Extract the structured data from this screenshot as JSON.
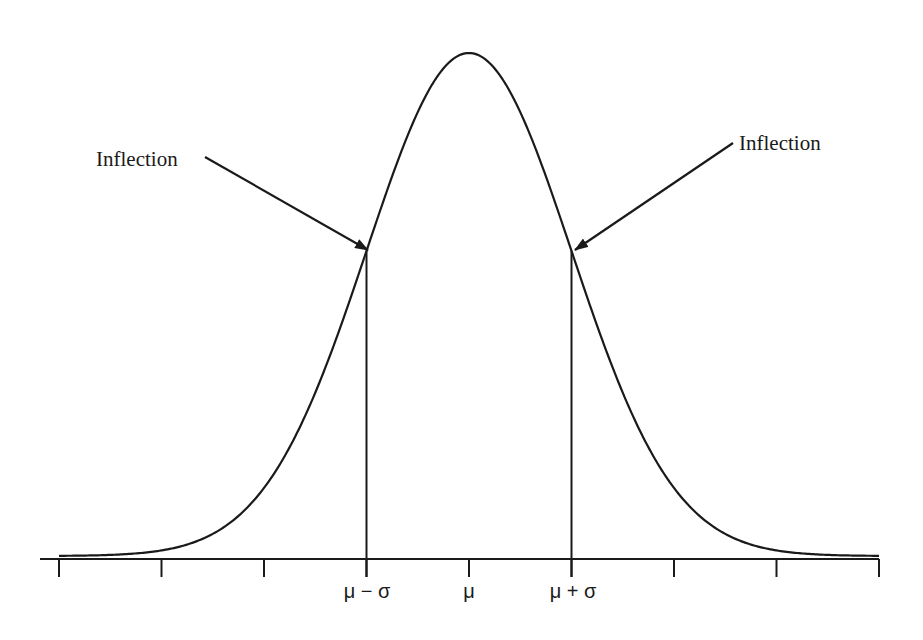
{
  "figure": {
    "type": "normal-distribution-diagram",
    "colors": {
      "ink": "#1a1a1a",
      "background": "#ffffff"
    },
    "annotations": [
      {
        "label": "Inflection",
        "side": "left",
        "points_to": "μ − σ"
      },
      {
        "label": "Inflection",
        "side": "right",
        "points_to": "μ + σ"
      }
    ],
    "axis": {
      "tick_count": 9,
      "labels": [
        {
          "text": "μ − σ",
          "tick_index": 3
        },
        {
          "text": "μ",
          "tick_index": 4
        },
        {
          "text": "μ + σ",
          "tick_index": 5
        }
      ]
    }
  },
  "chart_data": {
    "type": "line",
    "title": "",
    "xlabel": "",
    "ylabel": "",
    "x_ticks_sigma": [
      -4,
      -3,
      -2,
      -1,
      0,
      1,
      2,
      3,
      4
    ],
    "x_tick_labels": [
      "",
      "",
      "",
      "μ − σ",
      "μ",
      "μ + σ",
      "",
      "",
      ""
    ],
    "xlim_sigma": [
      -4,
      4
    ],
    "series": [
      {
        "name": "normal density",
        "function": "exp(-z^2/2)",
        "z_range": [
          -4,
          4
        ]
      }
    ],
    "vertical_lines_sigma": [
      -1,
      1
    ],
    "annotations": [
      {
        "text": "Inflection",
        "x_sigma": -1
      },
      {
        "text": "Inflection",
        "x_sigma": 1
      }
    ],
    "grid": false,
    "legend": null
  }
}
